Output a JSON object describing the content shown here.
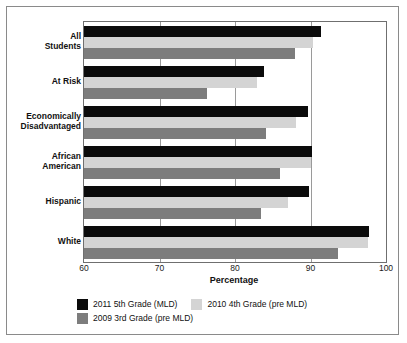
{
  "chart_data": {
    "type": "bar",
    "orientation": "horizontal",
    "title": "",
    "xlabel": "Percentage",
    "ylabel": "",
    "xlim": [
      60,
      100
    ],
    "xticks": [
      60,
      70,
      80,
      90,
      100
    ],
    "grid": true,
    "legend_position": "bottom",
    "categories": [
      "All\nStudents",
      "At Risk",
      "Economically\nDisadvantaged",
      "African\nAmerican",
      "Hispanic",
      "White"
    ],
    "category_labels": [
      [
        "All",
        "Students"
      ],
      [
        "At Risk"
      ],
      [
        "Economically",
        "Disadvantaged"
      ],
      [
        "African",
        "American"
      ],
      [
        "Hispanic"
      ],
      [
        "White"
      ]
    ],
    "series": [
      {
        "name": "2011 5th Grade (MLD)",
        "color": "#0b0b0b",
        "values": [
          91.4,
          83.8,
          89.7,
          90.2,
          89.8,
          97.7
        ]
      },
      {
        "name": "2010 4th Grade (pre MLD)",
        "color": "#d4d4d4",
        "values": [
          90.3,
          82.9,
          88.1,
          90.0,
          87.0,
          97.6
        ]
      },
      {
        "name": "2009 3rd Grade (pre MLD)",
        "color": "#7d7d7d",
        "values": [
          88.0,
          76.3,
          84.1,
          85.9,
          83.4,
          93.6
        ]
      }
    ]
  },
  "axis": {
    "x_title": "Percentage",
    "tick_labels": [
      "60",
      "70",
      "80",
      "90",
      "100"
    ]
  },
  "legend": {
    "items": [
      {
        "label": "2011 5th Grade (MLD)",
        "color": "#0b0b0b"
      },
      {
        "label": "2010 4th Grade (pre MLD)",
        "color": "#d4d4d4"
      },
      {
        "label": "2009 3rd Grade (pre MLD)",
        "color": "#7d7d7d"
      }
    ]
  }
}
